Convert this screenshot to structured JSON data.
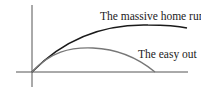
{
  "diagram": {
    "title": "",
    "curves": [
      {
        "label": "The massive home run",
        "color": "#1a1a1a"
      },
      {
        "label": "The easy out",
        "color": "#777777"
      }
    ],
    "axes": {
      "color": "#555555"
    }
  }
}
